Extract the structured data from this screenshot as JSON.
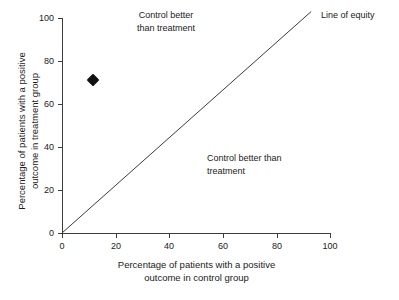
{
  "chart_data": {
    "type": "scatter",
    "title": "",
    "xlabel": "Percentage of patients with a positive\noutcome in control group",
    "ylabel": "Percentage of patients with a positive\noutcome in treatment  group",
    "xlim": [
      0,
      100
    ],
    "ylim": [
      0,
      100
    ],
    "grid": false,
    "legend": "none",
    "x_ticks": [
      0,
      20,
      40,
      60,
      80,
      100
    ],
    "y_ticks": [
      0,
      20,
      40,
      60,
      80,
      100
    ],
    "x_tick_labels": [
      "0",
      "20",
      "40",
      "60",
      "80",
      "100"
    ],
    "y_tick_labels": [
      "0",
      "20",
      "40",
      "60",
      "80",
      "100"
    ],
    "series": [
      {
        "name": "Trial result",
        "marker": "diamond",
        "color": "#111111",
        "points": [
          {
            "x": 11.5,
            "y": 71
          }
        ]
      }
    ],
    "reference_lines": [
      {
        "name": "Line of equity",
        "from": {
          "x": 0,
          "y": 0
        },
        "to": {
          "x": 93,
          "y": 103
        },
        "slope": 1,
        "intercept": 0,
        "color": "#3c3c3c"
      }
    ],
    "annotations": [
      {
        "id": "quadrant-upper-left",
        "text": "Control better\nthan treatment",
        "x": 22,
        "y": 98,
        "align": "center"
      },
      {
        "id": "quadrant-lower-right",
        "text": "Control  better than\ntreatment",
        "x": 54,
        "y": 45,
        "align": "left"
      },
      {
        "id": "line-of-equity-label",
        "text": "Line of equity",
        "x": 97,
        "y": 98,
        "align": "left"
      }
    ]
  },
  "axes": {
    "x_title": "Percentage of patients with a positive\noutcome in control group",
    "y_title": "Percentage of patients with a positive\noutcome in treatment  group",
    "x_tick_labels": [
      "0",
      "20",
      "40",
      "60",
      "80",
      "100"
    ],
    "y_tick_labels": [
      "0",
      "20",
      "40",
      "60",
      "80",
      "100"
    ]
  },
  "annotations": {
    "upper_left": "Control better\nthan treatment",
    "lower_right": "Control  better than\ntreatment",
    "equity": "Line of equity"
  },
  "colors": {
    "axis": "#3c3c3c",
    "marker": "#111111",
    "equity_line": "#3c3c3c",
    "text": "#1a1a1a",
    "background": "#ffffff"
  }
}
